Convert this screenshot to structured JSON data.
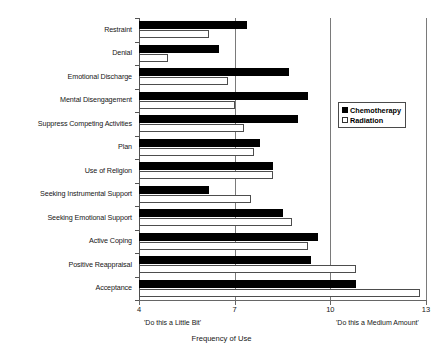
{
  "chart_data": {
    "type": "bar",
    "orientation": "horizontal",
    "title": "",
    "xlabel": "Frequency of Use",
    "ylabel": "",
    "xlim": [
      4,
      13
    ],
    "xticks": [
      "4",
      "7",
      "10",
      "13"
    ],
    "grid": true,
    "legend_position": "right",
    "axis_anchors": {
      "low": "'Do this a Little Bit'",
      "high": "'Do this a Medium Amount'"
    },
    "categories": [
      "Restraint",
      "Denial",
      "Emotional Discharge",
      "Mental Disengagement",
      "Suppress Competing Activities",
      "Plan",
      "Use of Religion",
      "Seeking Instrumental Support",
      "Seeking Emotional Support",
      "Active Coping",
      "Positive Reappraisal",
      "Acceptance"
    ],
    "series": [
      {
        "name": "Chemotherapy",
        "color": "#000000",
        "values": [
          7.4,
          6.5,
          8.7,
          9.3,
          9.0,
          7.8,
          8.2,
          6.2,
          8.5,
          9.6,
          9.4,
          10.8
        ]
      },
      {
        "name": "Radiation",
        "color": "#ffffff",
        "values": [
          6.2,
          4.9,
          6.8,
          7.0,
          7.3,
          7.6,
          8.2,
          7.5,
          8.8,
          9.3,
          10.8,
          12.8
        ]
      }
    ]
  },
  "legend": {
    "entries": [
      {
        "label": "Chemotherapy",
        "marker": "filled-square-icon"
      },
      {
        "label": "Radiation",
        "marker": "empty-square-icon"
      }
    ]
  }
}
